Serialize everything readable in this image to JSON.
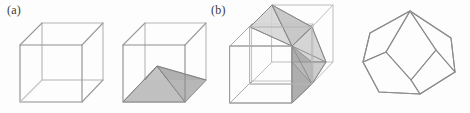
{
  "figure": {
    "background_color": "#fdfdfd",
    "line_color": "#8a8a8a",
    "line_color_dark": "#6f6f6f",
    "line_color_light": "#c2c2c2",
    "shade_fill_mid": "#b9b9b9",
    "shade_fill_light": "#cfcfcf",
    "shade_fill_dark": "#a7a7a7",
    "panels": [
      {
        "id": "a",
        "label": "(a)",
        "caption_text": "(a)",
        "items": [
          {
            "name": "cube-empty",
            "description": "wireframe cube",
            "shaded": false
          },
          {
            "name": "cube-with-pyramid",
            "description": "wireframe cube containing a shaded square pyramid whose apex is the cube centre and whose base is the cube bottom face",
            "shaded": true
          }
        ]
      },
      {
        "id": "b",
        "label": "(b)",
        "caption_text": "(b)",
        "items": [
          {
            "name": "two-offset-cubes",
            "description": "two interpenetrating offset wireframe cubes with a shaded rhombic pyramid region shared between them",
            "shaded": true
          },
          {
            "name": "rhombic-dodecahedron",
            "description": "wireframe rhombic dodecahedron outline",
            "shaded": false
          }
        ]
      }
    ]
  }
}
